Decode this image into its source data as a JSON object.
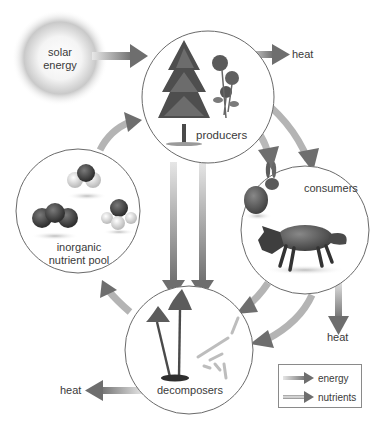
{
  "diagram": {
    "nodes": {
      "solar": {
        "label_line1": "solar",
        "label_line2": "energy"
      },
      "producers": {
        "label": "producers",
        "icons": [
          "tree-icon",
          "flower-icon"
        ]
      },
      "consumers": {
        "label": "consumers",
        "icons": [
          "rabbit-icon",
          "fox-icon"
        ]
      },
      "decomposers": {
        "label": "decomposers",
        "icons": [
          "mushroom-icon",
          "bacteria-icon"
        ]
      },
      "inorganic": {
        "label_line1": "inorganic",
        "label_line2": "nutrient pool",
        "icons": [
          "molecule-icon"
        ]
      }
    },
    "heat_labels": {
      "producers": "heat",
      "consumers": "heat",
      "decomposers": "heat"
    },
    "flows": [
      {
        "from": "solar energy",
        "to": "producers",
        "type": "energy"
      },
      {
        "from": "producers",
        "to": "heat",
        "type": "energy"
      },
      {
        "from": "producers",
        "to": "consumers",
        "type": "energy"
      },
      {
        "from": "producers",
        "to": "consumers",
        "type": "nutrients"
      },
      {
        "from": "producers",
        "to": "decomposers",
        "type": "energy"
      },
      {
        "from": "producers",
        "to": "decomposers",
        "type": "nutrients"
      },
      {
        "from": "consumers",
        "to": "decomposers",
        "type": "energy"
      },
      {
        "from": "consumers",
        "to": "decomposers",
        "type": "nutrients"
      },
      {
        "from": "consumers",
        "to": "heat",
        "type": "energy"
      },
      {
        "from": "decomposers",
        "to": "heat",
        "type": "energy"
      },
      {
        "from": "decomposers",
        "to": "inorganic nutrient pool",
        "type": "nutrients"
      },
      {
        "from": "inorganic nutrient pool",
        "to": "producers",
        "type": "nutrients"
      }
    ]
  },
  "legend": {
    "items": [
      {
        "label": "energy",
        "type": "energy"
      },
      {
        "label": "nutrients",
        "type": "nutrients"
      }
    ]
  },
  "colors": {
    "arrow_dark": "#6e6e6e",
    "arrow_light": "#d8d8d8",
    "circle_stroke": "#6a6a6a",
    "text": "#3a3a3a"
  }
}
